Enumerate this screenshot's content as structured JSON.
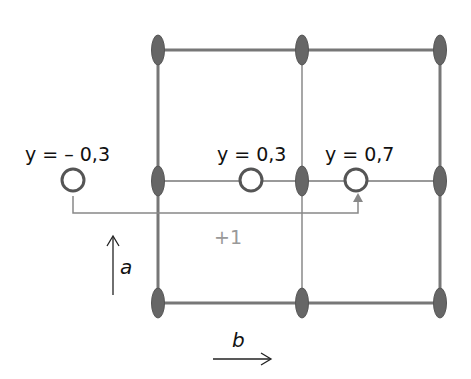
{
  "diagram": {
    "labels": {
      "y_neg": "y = – 0,3",
      "y_03": "y = 0,3",
      "y_07": "y = 0,7",
      "translation": "+1",
      "axis_a": "a",
      "axis_b": "b"
    },
    "colors": {
      "lattice_line": "#777777",
      "node_fill": "#666666",
      "circle_stroke": "#555555",
      "translation_text": "#999999"
    },
    "lattice": {
      "columns_x": [
        158,
        302,
        440
      ],
      "rows_y": [
        50,
        181,
        303
      ]
    },
    "atoms": [
      {
        "label": "y = – 0,3",
        "x": 73,
        "y": 180
      },
      {
        "label": "y = 0,3",
        "x": 251,
        "y": 180
      },
      {
        "label": "y = 0,7",
        "x": 356,
        "y": 180
      }
    ]
  }
}
